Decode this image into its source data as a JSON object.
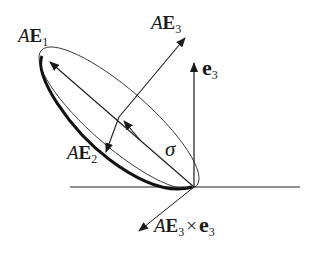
{
  "diagram": {
    "labels": {
      "ae1": {
        "A": "A",
        "E": "E",
        "sub": "1"
      },
      "ae2": {
        "A": "A",
        "E": "E",
        "sub": "2"
      },
      "ae3": {
        "A": "A",
        "E": "E",
        "sub": "3"
      },
      "e3": {
        "e": "e",
        "sub": "3"
      },
      "sigma": "σ",
      "cross": {
        "A": "A",
        "E": "E",
        "sub1": "3",
        "times": "×",
        "e": "e",
        "sub2": "3"
      }
    },
    "colors": {
      "ink": "#1a1a1a",
      "background": "#ffffff"
    }
  }
}
